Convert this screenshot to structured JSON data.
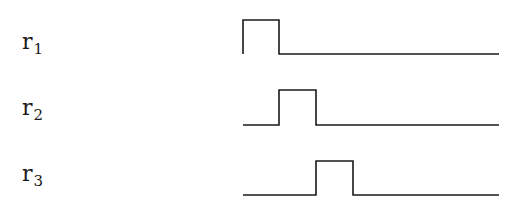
{
  "diagram": {
    "type": "timing-diagram",
    "signals": [
      {
        "name": "r",
        "subscript": "1",
        "baseline_y": 54,
        "high_y": 20,
        "pulse_start_x": 243,
        "pulse_end_x": 279,
        "line_start_x": 243,
        "line_end_x": 499,
        "starts_high": true
      },
      {
        "name": "r",
        "subscript": "2",
        "baseline_y": 125,
        "high_y": 90,
        "pulse_start_x": 279,
        "pulse_end_x": 316,
        "line_start_x": 243,
        "line_end_x": 499,
        "starts_high": false
      },
      {
        "name": "r",
        "subscript": "3",
        "baseline_y": 195,
        "high_y": 161,
        "pulse_start_x": 316,
        "pulse_end_x": 353,
        "line_start_x": 243,
        "line_end_x": 499,
        "starts_high": false
      }
    ],
    "stroke_color": "#1a1a1a"
  }
}
